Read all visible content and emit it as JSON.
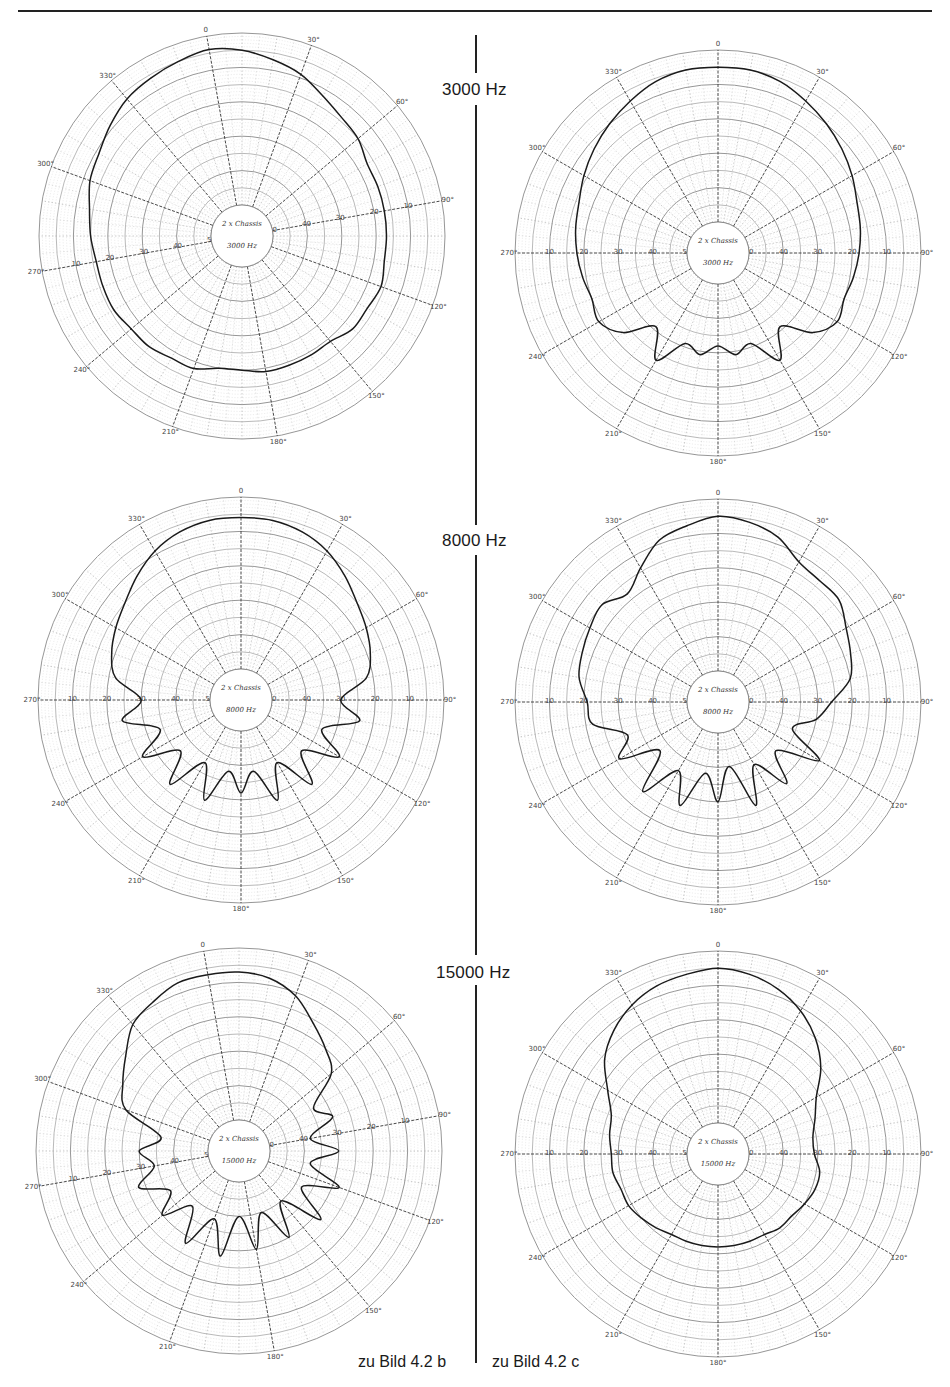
{
  "page": {
    "frequency_labels": [
      "3000 Hz",
      "8000 Hz",
      "15000 Hz"
    ],
    "captions": {
      "left": "zu Bild 4.2 b",
      "right": "zu Bild 4.2 c"
    }
  },
  "chart_data": [
    {
      "type": "polar-line",
      "title": "3000 Hz — zu Bild 4.2 b",
      "frequency": "3000 Hz",
      "column": "zu Bild 4.2 b",
      "center_note": [
        "2 x Chassis",
        "3000 Hz"
      ],
      "angle_ticks": [
        0,
        30,
        60,
        90,
        120,
        150,
        180,
        210,
        240,
        270,
        300,
        330
      ],
      "radial_ticks_db": [
        0,
        10,
        20,
        30,
        40,
        50
      ],
      "rotation_deg": -10,
      "angles_deg": [
        0,
        10,
        20,
        30,
        40,
        50,
        60,
        70,
        80,
        90,
        100,
        110,
        120,
        130,
        140,
        150,
        160,
        170,
        180,
        190,
        200,
        210,
        220,
        230,
        240,
        250,
        260,
        270,
        280,
        290,
        300,
        310,
        320,
        330,
        340,
        350
      ],
      "level_db": [
        4,
        5,
        7,
        9,
        12,
        14,
        15,
        17,
        17,
        17,
        17,
        17,
        16,
        17,
        17,
        19,
        19,
        19,
        19,
        20,
        20,
        18,
        18,
        17,
        17,
        16,
        16,
        16,
        15,
        14,
        12,
        11,
        9,
        7,
        6,
        5
      ]
    },
    {
      "type": "polar-line",
      "title": "3000 Hz — zu Bild 4.2 c",
      "frequency": "3000 Hz",
      "column": "zu Bild 4.2 c",
      "center_note": [
        "2 x Chassis",
        "3000 Hz"
      ],
      "angle_ticks": [
        0,
        30,
        60,
        90,
        120,
        150,
        180,
        210,
        240,
        270,
        300,
        330
      ],
      "radial_ticks_db": [
        0,
        10,
        20,
        30,
        40,
        50
      ],
      "rotation_deg": 0,
      "angles_deg": [
        0,
        10,
        20,
        30,
        40,
        50,
        60,
        70,
        80,
        90,
        100,
        110,
        120,
        130,
        140,
        150,
        160,
        170,
        180,
        190,
        200,
        210,
        220,
        230,
        240,
        250,
        260,
        270,
        280,
        290,
        300,
        310,
        320,
        330,
        340,
        350
      ],
      "level_db": [
        5,
        5,
        6,
        8,
        10,
        12,
        14,
        16,
        17,
        18,
        19,
        20,
        19,
        23,
        31,
        23,
        31,
        29,
        32,
        29,
        31,
        23,
        31,
        23,
        19,
        20,
        19,
        18,
        17,
        16,
        14,
        12,
        10,
        8,
        6,
        5
      ]
    },
    {
      "type": "polar-line",
      "title": "8000 Hz — zu Bild 4.2 b",
      "frequency": "8000 Hz",
      "column": "zu Bild 4.2 b",
      "center_note": [
        "2 x Chassis",
        "8000 Hz"
      ],
      "angle_ticks": [
        0,
        30,
        60,
        90,
        120,
        150,
        180,
        210,
        240,
        270,
        300,
        330
      ],
      "radial_ticks_db": [
        0,
        10,
        20,
        30,
        40,
        50
      ],
      "rotation_deg": 0,
      "angles_deg": [
        0,
        10,
        20,
        30,
        40,
        50,
        60,
        70,
        80,
        90,
        100,
        110,
        120,
        130,
        140,
        150,
        160,
        170,
        180,
        190,
        200,
        210,
        220,
        230,
        240,
        250,
        260,
        270,
        280,
        290,
        300,
        310,
        320,
        330,
        340,
        350
      ],
      "level_db": [
        6,
        6,
        7,
        9,
        12,
        15,
        17,
        19,
        22,
        30,
        24,
        34,
        26,
        36,
        27,
        38,
        28,
        38,
        32,
        38,
        28,
        38,
        27,
        36,
        26,
        34,
        24,
        30,
        22,
        19,
        17,
        15,
        12,
        9,
        7,
        6
      ]
    },
    {
      "type": "polar-line",
      "title": "8000 Hz — zu Bild 4.2 c",
      "frequency": "8000 Hz",
      "column": "zu Bild 4.2 c",
      "center_note": [
        "2 x Chassis",
        "8000 Hz"
      ],
      "angle_ticks": [
        0,
        30,
        60,
        90,
        120,
        150,
        180,
        210,
        240,
        270,
        300,
        330
      ],
      "radial_ticks_db": [
        0,
        10,
        20,
        30,
        40,
        50
      ],
      "rotation_deg": 0,
      "angles_deg": [
        0,
        10,
        20,
        30,
        40,
        50,
        60,
        70,
        80,
        90,
        100,
        110,
        120,
        130,
        140,
        150,
        160,
        170,
        180,
        190,
        200,
        210,
        220,
        230,
        240,
        250,
        260,
        270,
        280,
        290,
        300,
        310,
        320,
        330,
        340,
        350
      ],
      "level_db": [
        5,
        6,
        8,
        12,
        13,
        13,
        16,
        18,
        20,
        26,
        30,
        36,
        25,
        37,
        28,
        38,
        27,
        40,
        30,
        38,
        27,
        36,
        25,
        37,
        26,
        31,
        22,
        21,
        18,
        17,
        16,
        15,
        18,
        14,
        9,
        7
      ]
    },
    {
      "type": "polar-line",
      "title": "15000 Hz — zu Bild 4.2 b",
      "frequency": "15000 Hz",
      "column": "zu Bild 4.2 b",
      "center_note": [
        "2 x Chassis",
        "15000 Hz"
      ],
      "angle_ticks": [
        0,
        30,
        60,
        90,
        120,
        150,
        180,
        210,
        240,
        270,
        300,
        330
      ],
      "radial_ticks_db": [
        0,
        10,
        20,
        30,
        40,
        50
      ],
      "rotation_deg": -10,
      "angles_deg": [
        0,
        10,
        20,
        30,
        40,
        50,
        60,
        70,
        80,
        90,
        100,
        110,
        120,
        130,
        140,
        150,
        160,
        170,
        180,
        190,
        200,
        210,
        220,
        230,
        240,
        250,
        260,
        270,
        280,
        290,
        300,
        310,
        320,
        330,
        340,
        350
      ],
      "level_db": [
        7,
        7,
        8,
        11,
        16,
        20,
        24,
        34,
        30,
        38,
        30,
        38,
        28,
        38,
        28,
        40,
        30,
        40,
        30,
        40,
        28,
        38,
        28,
        38,
        30,
        36,
        28,
        34,
        30,
        36,
        24,
        20,
        16,
        11,
        9,
        7
      ]
    },
    {
      "type": "polar-line",
      "title": "15000 Hz — zu Bild 4.2 c",
      "frequency": "15000 Hz",
      "column": "zu Bild 4.2 c",
      "center_note": [
        "2 x Chassis",
        "15000 Hz"
      ],
      "angle_ticks": [
        0,
        30,
        60,
        90,
        120,
        150,
        180,
        210,
        240,
        270,
        300,
        330
      ],
      "radial_ticks_db": [
        0,
        10,
        20,
        30,
        40,
        50
      ],
      "rotation_deg": 0,
      "angles_deg": [
        0,
        10,
        20,
        30,
        40,
        50,
        60,
        70,
        80,
        90,
        100,
        110,
        120,
        130,
        140,
        150,
        160,
        170,
        180,
        190,
        200,
        210,
        220,
        230,
        240,
        250,
        260,
        270,
        280,
        290,
        300,
        310,
        320,
        330,
        340,
        350
      ],
      "level_db": [
        5,
        6,
        8,
        11,
        15,
        20,
        26,
        29,
        31,
        31,
        29,
        29,
        30,
        31,
        31,
        32,
        32,
        32,
        32,
        32,
        32,
        32,
        31,
        30,
        29,
        29,
        28,
        28,
        27,
        26,
        22,
        16,
        12,
        9,
        7,
        6
      ]
    }
  ]
}
